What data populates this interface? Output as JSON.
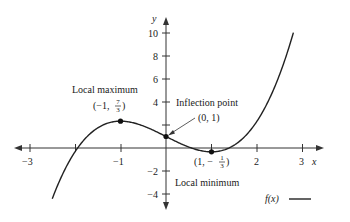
{
  "chart_data": {
    "type": "line",
    "title": "",
    "function": "f(x) = (2/3)x^3 - 2x + 1",
    "xlabel": "x",
    "ylabel": "y",
    "xlim": [
      -3.3,
      3.3
    ],
    "ylim": [
      -5,
      11
    ],
    "x_ticks": [
      -3,
      -2,
      -1,
      1,
      2,
      3
    ],
    "x_tick_labels": [
      "−3",
      "−1",
      "2",
      "3"
    ],
    "x_tick_labels_at": [
      -3,
      -1,
      2,
      3
    ],
    "y_ticks": [
      -4,
      -2,
      2,
      4,
      6,
      8,
      10
    ],
    "y_tick_labels": [
      "10",
      "8",
      "6",
      "4",
      "−2",
      "−4"
    ],
    "y_tick_labels_at": [
      10,
      8,
      6,
      4,
      -2,
      -4
    ],
    "grid": false,
    "series": [
      {
        "name": "f(x)",
        "x": [
          -2.5,
          -2.0,
          -1.5,
          -1.0,
          -0.5,
          0.0,
          0.5,
          1.0,
          1.5,
          2.0,
          2.5,
          2.8
        ],
        "y": [
          -4.42,
          -0.33,
          1.75,
          2.33,
          1.92,
          1.0,
          0.08,
          -0.33,
          0.25,
          2.33,
          6.42,
          10.03
        ]
      }
    ],
    "points": [
      {
        "name": "Local maximum",
        "x": -1,
        "y": 2.333,
        "label": "(−1, 7/3)"
      },
      {
        "name": "Inflection point",
        "x": 0,
        "y": 1,
        "label": "(0, 1)"
      },
      {
        "name": "Local minimum",
        "x": 1,
        "y": -0.333,
        "label": "(1, −1/3)"
      }
    ],
    "legend": {
      "entries": [
        "f(x)"
      ],
      "position": "bottom-right"
    }
  },
  "labels": {
    "x_axis": "x",
    "y_axis": "y",
    "local_max_title": "Local maximum",
    "local_max_coord_prefix": "(−1,",
    "local_max_num": "7",
    "local_max_den": "3",
    "inflection_title": "Inflection point",
    "inflection_coord": "(0, 1)",
    "local_min_title": "Local minimum",
    "local_min_coord_prefix": "(1, −",
    "local_min_num": "1",
    "local_min_den": "3",
    "legend_label": "f(x)",
    "xt_m3": "−3",
    "xt_m1": "−1",
    "xt_2": "2",
    "xt_3": "3",
    "yt_10": "10",
    "yt_8": "8",
    "yt_6": "6",
    "yt_4": "4",
    "yt_m2": "−2",
    "yt_m4": "−4"
  }
}
